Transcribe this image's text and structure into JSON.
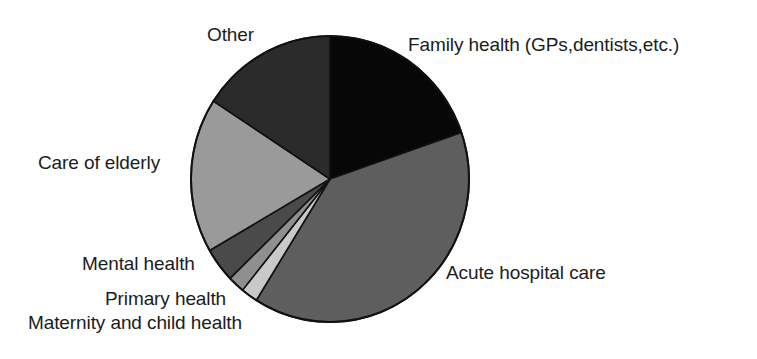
{
  "chart_data": {
    "type": "pie",
    "title": "",
    "subtitle": "",
    "xlabel": "",
    "ylabel": "",
    "legend_position": "none",
    "grid": false,
    "labels_outside": true,
    "start_angle_deg": 0,
    "direction": "clockwise",
    "categories": [
      "Family health (GPs,dentists,etc.)",
      "Acute hospital care",
      "Maternity and child health",
      "Primary health",
      "Mental health",
      "Care of elderly",
      "Other"
    ],
    "values": [
      19.7,
      39.2,
      1.9,
      1.9,
      3.9,
      17.6,
      15.8
    ],
    "value_unit": "percent",
    "slices": [
      {
        "label": "Family health (GPs,dentists,etc.)",
        "value": 19.7,
        "start_deg": 0,
        "end_deg": 71,
        "color": "#070707",
        "label_side": "right"
      },
      {
        "label": "Acute hospital care",
        "value": 39.2,
        "start_deg": 71,
        "end_deg": 212,
        "color": "#5e5e5e",
        "label_side": "right"
      },
      {
        "label": "Maternity and child health",
        "value": 1.9,
        "start_deg": 212,
        "end_deg": 219,
        "color": "#c9c9c9",
        "label_side": "left"
      },
      {
        "label": "Primary health",
        "value": 1.9,
        "start_deg": 219,
        "end_deg": 226,
        "color": "#8f8f8f",
        "label_side": "left"
      },
      {
        "label": "Mental health",
        "value": 3.9,
        "start_deg": 226,
        "end_deg": 240,
        "color": "#4a4a4a",
        "label_side": "left"
      },
      {
        "label": "Care of elderly",
        "value": 17.6,
        "start_deg": 240,
        "end_deg": 303,
        "color": "#9a9a9a",
        "label_side": "left"
      },
      {
        "label": "Other",
        "value": 15.8,
        "start_deg": 303,
        "end_deg": 360,
        "color": "#2b2b2b",
        "label_side": "left"
      }
    ],
    "geometry": {
      "center_x": 330,
      "center_y": 179,
      "radius_x": 139,
      "radius_y": 143,
      "outline_color": "#111111",
      "background": "#ffffff"
    }
  },
  "labels": {
    "family": "Family health (GPs,dentists,etc.)",
    "acute": "Acute hospital care",
    "other": "Other",
    "elderly": "Care of elderly",
    "mental": "Mental health",
    "primary": "Primary health",
    "maternity": "Maternity and child health"
  }
}
